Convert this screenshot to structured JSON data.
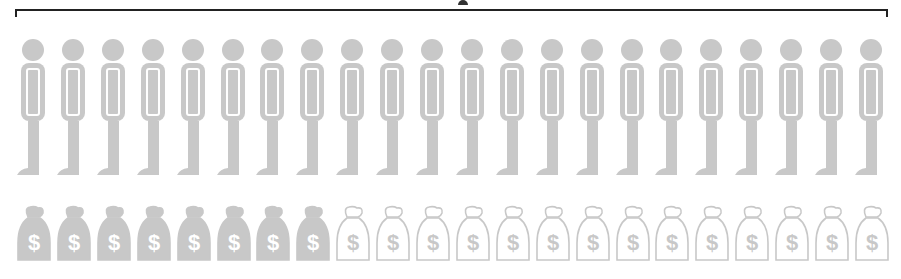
{
  "figure": {
    "bracket_label": "",
    "colors": {
      "icon_fill": "#c8c8c8",
      "bracket": "#222222",
      "background": "#ffffff"
    }
  },
  "people": {
    "count": 22,
    "icon": "person-icon"
  },
  "money_bags": {
    "count": 22,
    "filled": 8,
    "outlined": 14,
    "icon": "money-bag-icon",
    "glyph": "$"
  }
}
